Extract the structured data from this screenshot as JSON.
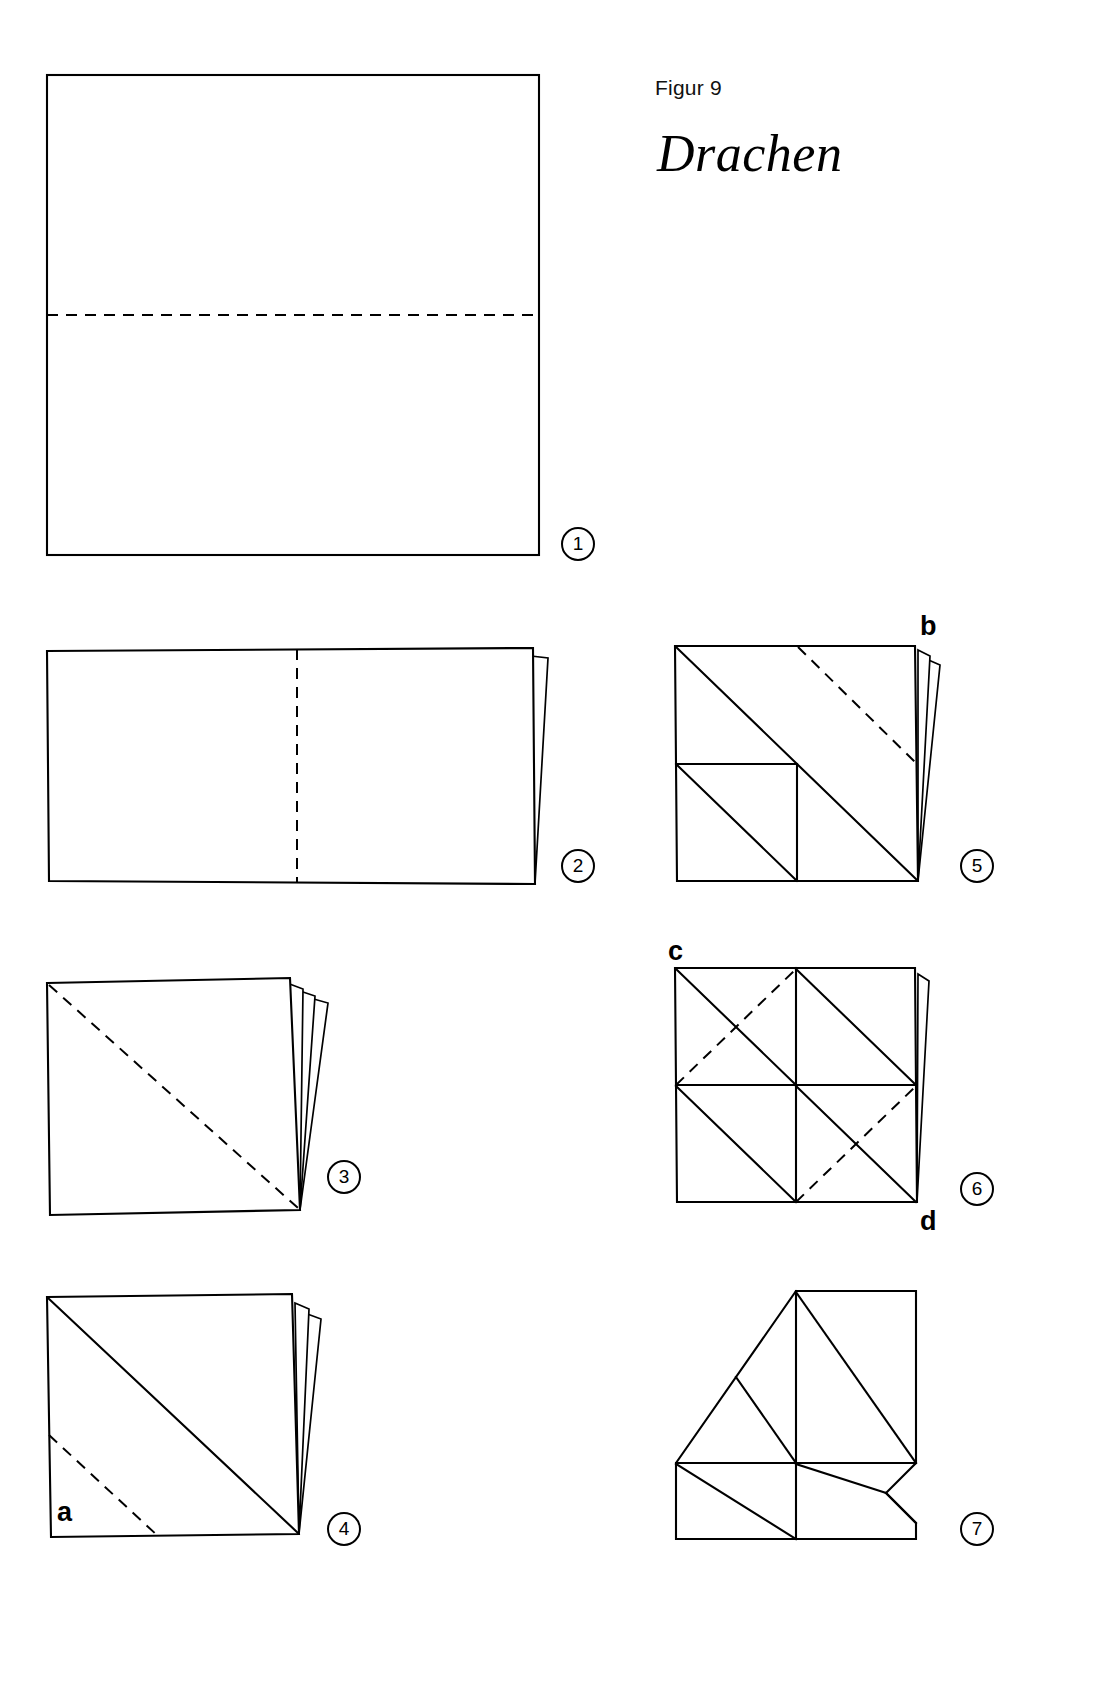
{
  "header": {
    "figure_label": "Figur 9",
    "title": "Drachen"
  },
  "steps": [
    {
      "number": "1",
      "id": "step-1"
    },
    {
      "number": "2",
      "id": "step-2"
    },
    {
      "number": "3",
      "id": "step-3"
    },
    {
      "number": "4",
      "id": "step-4"
    },
    {
      "number": "5",
      "id": "step-5"
    },
    {
      "number": "6",
      "id": "step-6"
    },
    {
      "number": "7",
      "id": "step-7"
    }
  ],
  "point_labels": {
    "a": "a",
    "b": "b",
    "c": "c",
    "d": "d"
  },
  "colors": {
    "ink": "#000000",
    "paper": "#ffffff"
  },
  "diagram_data": {
    "type": "origami-fold-sequence",
    "model_name": "Drachen",
    "figure_number": "Figur 9",
    "line_legend": {
      "solid": "paper edge / existing crease",
      "dashed": "fold line (valley)"
    },
    "panels": [
      {
        "step": "1",
        "shape": "square",
        "description": "Full square sheet with a horizontal dashed fold line across the middle.",
        "folds": [
          "horizontal-midline-dashed"
        ],
        "flaps": 0
      },
      {
        "step": "2",
        "shape": "rectangle-2:1",
        "description": "Sheet folded in half horizontally; vertical dashed fold line at the middle; one thin tapering flap at the right edge.",
        "folds": [
          "vertical-midline-dashed"
        ],
        "flaps": 1
      },
      {
        "step": "3",
        "shape": "square",
        "description": "Folded again into a square; diagonal dashed fold line from top-left to bottom-right; three tapering flaps converging at the bottom-right corner.",
        "folds": [
          "main-diagonal-dashed"
        ],
        "flaps": 3
      },
      {
        "step": "4",
        "shape": "square",
        "description": "Square with a solid diagonal crease top-left to bottom-right, a short dashed fold in the lower-left region, and two flaps on the right. Corner a marked at bottom-left.",
        "folds": [
          "lower-left-parallel-dashed"
        ],
        "creases": [
          "main-diagonal-solid"
        ],
        "flaps": 2,
        "labels": [
          "a"
        ]
      },
      {
        "step": "5",
        "shape": "square",
        "description": "Square showing the main solid diagonal, a small square crease in the lower-left quadrant with its own diagonal, and a dashed fold parallel to the diagonal in the upper-right half. Corner b marked at top-right. Two flaps at the right.",
        "folds": [
          "upper-right-parallel-dashed"
        ],
        "creases": [
          "main-diagonal-solid",
          "lower-left-quadrant-square",
          "lower-left-quadrant-diagonal"
        ],
        "flaps": 2,
        "labels": [
          "b"
        ]
      },
      {
        "step": "6",
        "shape": "square",
        "description": "Square with a full crease grid: both main diagonals of the half-panels solid, horizontal and vertical centre lines, and dashed anti-diagonal folds in the upper-left and lower-right. Corner c at top-left, corner d at bottom-right. One flap at right.",
        "folds": [
          "upper-left-antidiagonal-dashed",
          "lower-right-antidiagonal-dashed"
        ],
        "creases": [
          "horizontal-centre",
          "vertical-centre",
          "panel-diagonals"
        ],
        "flaps": 1,
        "labels": [
          "c",
          "d"
        ]
      },
      {
        "step": "7",
        "shape": "pentagon",
        "description": "Result after folding the corners: the top-left corner is folded away giving a slanted edge, the right side shows a folded bevel at the bottom-right. Internal creases form a diamond grid.",
        "folds": [],
        "creases": [
          "horizontal-centre",
          "vertical-centre",
          "panel-diagonals"
        ],
        "flaps": 0
      }
    ]
  }
}
